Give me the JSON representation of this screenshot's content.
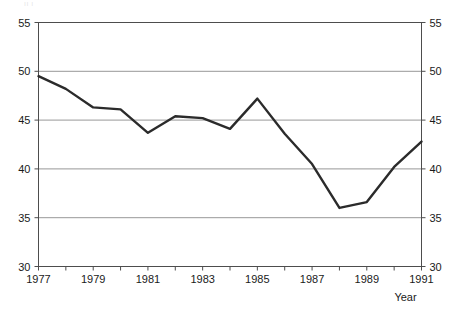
{
  "top_artifact_text": "ıı    ı",
  "chart_data": {
    "type": "line",
    "title": "",
    "xlabel": "Year",
    "ylabel": "",
    "x": [
      1977,
      1978,
      1979,
      1980,
      1981,
      1982,
      1983,
      1984,
      1985,
      1986,
      1987,
      1988,
      1989,
      1990,
      1991
    ],
    "values": [
      49.5,
      48.2,
      46.3,
      46.1,
      43.7,
      45.4,
      45.2,
      44.1,
      47.2,
      43.6,
      40.5,
      36.0,
      36.6,
      40.2,
      42.8
    ],
    "series": [
      {
        "name": "series-1",
        "values": [
          49.5,
          48.2,
          46.3,
          46.1,
          43.7,
          45.4,
          45.2,
          44.1,
          47.2,
          43.6,
          40.5,
          36.0,
          36.6,
          40.2,
          42.8
        ]
      }
    ],
    "xlim": [
      1977,
      1991
    ],
    "ylim": [
      30,
      55
    ],
    "y_ticks": [
      30,
      35,
      40,
      45,
      50,
      55
    ],
    "y_tick_labels_left": [
      "30",
      "35",
      "40",
      "45",
      "50",
      "55"
    ],
    "y_tick_labels_right": [
      "30",
      "35",
      "40",
      "45",
      "50",
      "55"
    ],
    "x_ticks": [
      1977,
      1978,
      1979,
      1980,
      1981,
      1982,
      1983,
      1984,
      1985,
      1986,
      1987,
      1988,
      1989,
      1990,
      1991
    ],
    "x_tick_labels": [
      {
        "year": 1977,
        "label": "1977"
      },
      {
        "year": 1979,
        "label": "1979"
      },
      {
        "year": 1981,
        "label": "1981"
      },
      {
        "year": 1983,
        "label": "1983"
      },
      {
        "year": 1985,
        "label": "1985"
      },
      {
        "year": 1987,
        "label": "1987"
      },
      {
        "year": 1989,
        "label": "1989"
      },
      {
        "year": 1991,
        "label": "1991"
      }
    ],
    "grid": {
      "horizontal": true,
      "vertical": false
    },
    "legend": {
      "visible": false,
      "position": "none"
    },
    "colors": {
      "line": "#2b2b2b",
      "grid": "#8c8c8c",
      "axis": "#4d4d4d",
      "text": "#1a1a1a",
      "background": "#ffffff"
    },
    "line_width": 2.4,
    "markers": false
  }
}
